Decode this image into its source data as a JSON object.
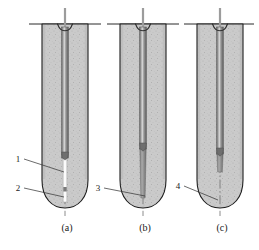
{
  "figure": {
    "background_color": "#ffffff",
    "width": 259,
    "height": 250
  },
  "colors": {
    "soil_fill": "#c9c9c9",
    "soil_stipple": "#a8a8a8",
    "outline": "#1d1d1d",
    "tube_dark": "#5c5c5c",
    "tube_mid": "#8f8f8f",
    "tube_light": "#e8e8e8",
    "centerline": "#6b6b6b",
    "leader_line": "#3a3a3a",
    "text": "#1a1a1a",
    "white": "#ffffff"
  },
  "panels": [
    {
      "id": "panel-a",
      "caption": "(a)",
      "caption_x": 67,
      "caption_y": 231,
      "center_x": 65,
      "tip_style": "white-grout-strip",
      "tube_bottom_y": 158
    },
    {
      "id": "panel-b",
      "caption": "(b)",
      "caption_x": 145,
      "caption_y": 231,
      "center_x": 143,
      "tip_style": "tapered-dark-cone",
      "tube_bottom_y": 150
    },
    {
      "id": "panel-c",
      "caption": "(c)",
      "caption_x": 222,
      "caption_y": 231,
      "center_x": 220,
      "tip_style": "short-dark-plug",
      "tube_bottom_y": 155
    }
  ],
  "callouts": [
    {
      "id": "callout-1",
      "label": "1",
      "text_x": 18,
      "text_y": 161,
      "line_x1": 24,
      "line_y1": 159,
      "line_x2": 64,
      "line_y2": 172,
      "panel": "panel-a"
    },
    {
      "id": "callout-2",
      "label": "2",
      "text_x": 18,
      "text_y": 190,
      "line_x1": 24,
      "line_y1": 188,
      "line_x2": 64,
      "line_y2": 196,
      "panel": "panel-a"
    },
    {
      "id": "callout-3",
      "label": "3",
      "text_x": 98,
      "text_y": 190,
      "line_x1": 104,
      "line_y1": 188,
      "line_x2": 145,
      "line_y2": 196,
      "panel": "panel-b"
    },
    {
      "id": "callout-4",
      "label": "4",
      "text_x": 178,
      "text_y": 188,
      "line_x1": 184,
      "line_y1": 186,
      "line_x2": 218,
      "line_y2": 199,
      "panel": "panel-c"
    }
  ],
  "geometry": {
    "ground_line_y": 24,
    "column_top_y": 24,
    "column_half_width": 23,
    "column_straight_bottom_y": 180,
    "column_tip_y": 208,
    "centerline_top_y": 8,
    "centerline_bottom_y": 216,
    "ground_line_extend": 13,
    "funnel_half_width": 7,
    "funnel_depth": 5,
    "tube_half_width": 3.2
  }
}
